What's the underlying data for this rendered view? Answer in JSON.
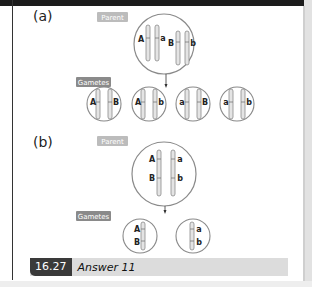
{
  "figure": {
    "part_a": {
      "label": "(a)",
      "parent_tag": "Parent",
      "gametes_tag": "Gametes",
      "parent_alleles": [
        "A",
        "a",
        "B",
        "b"
      ],
      "gametes": [
        {
          "left": "A",
          "right": "B"
        },
        {
          "left": "A",
          "right": "b"
        },
        {
          "left": "a",
          "right": "B"
        },
        {
          "left": "a",
          "right": "b"
        }
      ]
    },
    "part_b": {
      "label": "(b)",
      "parent_tag": "Parent",
      "gametes_tag": "Gametes",
      "parent_alleles": {
        "chrom1": [
          "A",
          "B"
        ],
        "chrom2": [
          "a",
          "b"
        ]
      },
      "gametes": [
        {
          "top": "A",
          "bottom": "B"
        },
        {
          "top": "a",
          "bottom": "b"
        }
      ]
    },
    "caption": {
      "number": "16.27",
      "text": "Answer 11"
    }
  },
  "colors": {
    "tag_light": "#b8b8b8",
    "tag_dark": "#8a8a8a",
    "circle": "#888888",
    "chromosome_fill": "#e4e4e4",
    "chromosome_stroke": "#8a8a8a",
    "caption_bg": "#dcdcdc",
    "caption_num_bg": "#3a3a3a"
  }
}
